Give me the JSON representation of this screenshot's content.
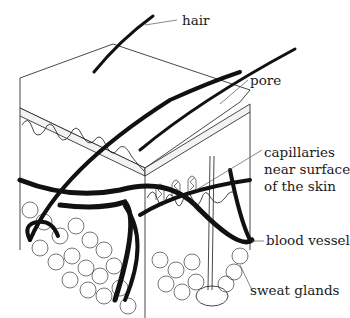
{
  "diagram": {
    "labels": {
      "hair": "hair",
      "pore": "pore",
      "capillaries_line1": "capillaries",
      "capillaries_line2": "near surface",
      "capillaries_line3": "of the skin",
      "blood_vessel": "blood vessel",
      "sweat_glands": "sweat glands"
    },
    "colors": {
      "line": "#1a1a1a",
      "background": "#ffffff",
      "leader": "#555555"
    }
  }
}
